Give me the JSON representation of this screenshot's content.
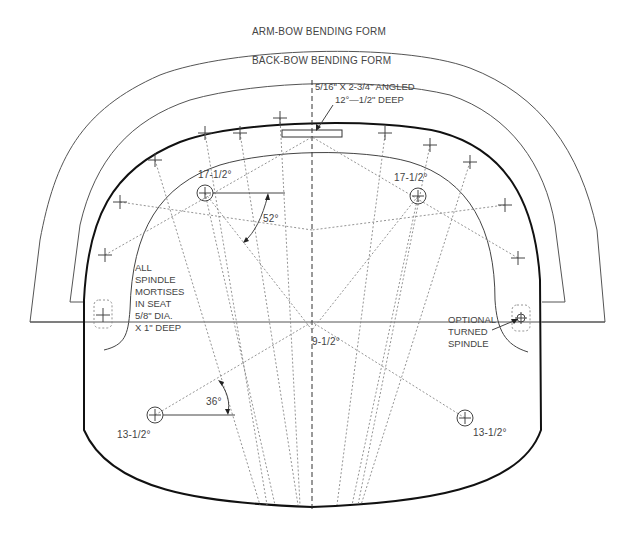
{
  "drawing": {
    "title_arm_bow": "ARM-BOW BENDING FORM",
    "title_back_bow": "BACK-BOW BENDING FORM",
    "mortise_note_line1": "5/16\" X 2-3/4\" ANGLED",
    "mortise_note_line2": "12°—1/2\" DEEP",
    "spindle_note": [
      "ALL",
      "SPINDLE",
      "MORTISES",
      "IN SEAT",
      "5/8\" DIA.",
      "X 1\" DEEP"
    ],
    "optional_note": [
      "OPTIONAL",
      "TURNED",
      "SPINDLE"
    ],
    "angle_52": "52°",
    "angle_36": "36°",
    "leg_front_left": "17-1/2°",
    "leg_front_right": "17-1/2°",
    "center_angle": "9-1/2°",
    "leg_rear_left": "13-1/2°",
    "leg_rear_right": "13-1/2°"
  }
}
